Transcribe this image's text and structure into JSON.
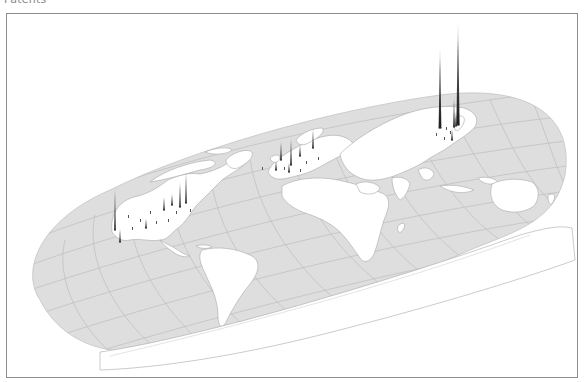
{
  "title": "Patents",
  "map": {
    "projection": "oblique 3D world map (tilted)",
    "colors": {
      "ocean": "#dedede",
      "land": "#ffffff",
      "graticule": "#bdbdbd",
      "coast": "#a8a8a8",
      "spike": "#1a1a1a",
      "frame": "#8c8c8c"
    },
    "regions": [
      "North America",
      "South America",
      "Europe",
      "Africa",
      "Asia",
      "Australia",
      "Antarctica"
    ]
  },
  "chart_data": {
    "type": "spike-map",
    "title": "Patents",
    "spikes": [
      {
        "region": "Japan (Tokyo)",
        "x": 458,
        "base_y": 125,
        "top_y": 20,
        "relative_height": 1.0
      },
      {
        "region": "South Korea (Seoul)",
        "x": 440,
        "base_y": 128,
        "top_y": 45,
        "relative_height": 0.79
      },
      {
        "region": "Japan (Osaka)",
        "x": 454,
        "base_y": 127,
        "top_y": 95,
        "relative_height": 0.3
      },
      {
        "region": "Japan (Nagoya)",
        "x": 456,
        "base_y": 126,
        "top_y": 110,
        "relative_height": 0.15
      },
      {
        "region": "China / Taiwan",
        "x": 452,
        "base_y": 140,
        "top_y": 128,
        "relative_height": 0.11
      },
      {
        "region": "USA West (San Francisco Bay)",
        "x": 115,
        "base_y": 230,
        "top_y": 185,
        "relative_height": 0.43
      },
      {
        "region": "USA Northeast (Boston)",
        "x": 186,
        "base_y": 203,
        "top_y": 170,
        "relative_height": 0.31
      },
      {
        "region": "USA Northeast (New York)",
        "x": 180,
        "base_y": 207,
        "top_y": 180,
        "relative_height": 0.26
      },
      {
        "region": "USA Midwest (Chicago)",
        "x": 164,
        "base_y": 210,
        "top_y": 196,
        "relative_height": 0.13
      },
      {
        "region": "USA Southwest (Los Angeles)",
        "x": 120,
        "base_y": 242,
        "top_y": 228,
        "relative_height": 0.13
      },
      {
        "region": "Canada (Toronto)",
        "x": 172,
        "base_y": 205,
        "top_y": 193,
        "relative_height": 0.11
      },
      {
        "region": "USA (Texas)",
        "x": 146,
        "base_y": 228,
        "top_y": 218,
        "relative_height": 0.1
      },
      {
        "region": "Europe (Germany South)",
        "x": 291,
        "base_y": 165,
        "top_y": 136,
        "relative_height": 0.28
      },
      {
        "region": "Europe (Sweden/Finland)",
        "x": 313,
        "base_y": 148,
        "top_y": 128,
        "relative_height": 0.19
      },
      {
        "region": "Europe (Netherlands)",
        "x": 281,
        "base_y": 160,
        "top_y": 140,
        "relative_height": 0.19
      },
      {
        "region": "Europe (Germany North)",
        "x": 300,
        "base_y": 156,
        "top_y": 144,
        "relative_height": 0.11
      },
      {
        "region": "Europe (France)",
        "x": 276,
        "base_y": 170,
        "top_y": 160,
        "relative_height": 0.1
      },
      {
        "region": "Europe (Switzerland)",
        "x": 289,
        "base_y": 172,
        "top_y": 162,
        "relative_height": 0.1
      }
    ],
    "xlabel": "",
    "ylabel": "",
    "legend": "none"
  }
}
